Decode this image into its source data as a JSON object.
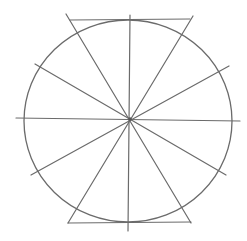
{
  "diagram": {
    "stroke_color": "#6b6b6b",
    "circle": {
      "cx": 128,
      "cy": 121,
      "rx": 104,
      "ry": 101
    },
    "center": {
      "x": 130,
      "y": 119
    },
    "radial_lines": [
      {
        "name": "vertical",
        "x1": 130,
        "y1": 15,
        "x2": 128,
        "y2": 231
      },
      {
        "name": "horizontal",
        "x1": 16,
        "y1": 118,
        "x2": 240,
        "y2": 121
      },
      {
        "name": "diag-upper-left-to-lower-right",
        "x1": 35,
        "y1": 64,
        "x2": 226,
        "y2": 175
      },
      {
        "name": "diag-upper-right-to-lower-left",
        "x1": 229,
        "y1": 66,
        "x2": 31,
        "y2": 175
      },
      {
        "name": "steep-left-to-right",
        "x1": 66,
        "y1": 14,
        "x2": 191,
        "y2": 223
      },
      {
        "name": "steep-right-to-left",
        "x1": 193,
        "y1": 16,
        "x2": 68,
        "y2": 223
      }
    ],
    "cap_lines": [
      {
        "name": "top-cap",
        "x1": 70,
        "y1": 20,
        "x2": 190,
        "y2": 19
      },
      {
        "name": "bottom-cap",
        "x1": 68,
        "y1": 223,
        "x2": 191,
        "y2": 222
      }
    ]
  }
}
